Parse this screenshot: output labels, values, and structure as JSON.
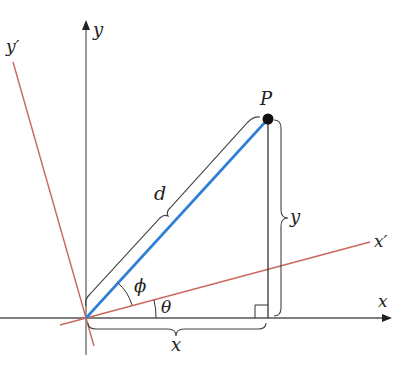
{
  "diagram": {
    "labels": {
      "y_axis": "y",
      "x_axis": "x",
      "y_prime": "y′",
      "x_prime": "x′",
      "point": "P",
      "distance": "d",
      "angle_phi": "ϕ",
      "angle_theta": "θ",
      "x_length": "x",
      "y_length": "y"
    },
    "colors": {
      "axes": "#555555",
      "rotated_axes": "#c8685c",
      "segment_d": "#2f7fd6",
      "point": "#111111",
      "bracket": "#444444"
    }
  }
}
